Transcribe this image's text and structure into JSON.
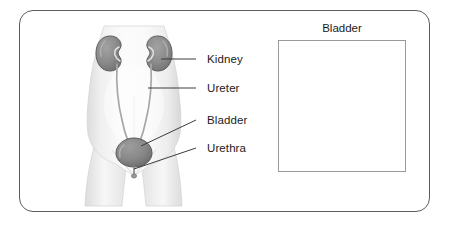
{
  "figure": {
    "kind": "medical-illustration",
    "frame": {
      "border_color": "#5c5c5c",
      "background": "#ffffff"
    }
  },
  "labels": [
    {
      "id": "kidney",
      "text": "Kidney",
      "x": 207,
      "y": 54,
      "leader": {
        "x1": 196,
        "y1": 59,
        "x2": 161,
        "y2": 59
      }
    },
    {
      "id": "ureter",
      "text": "Ureter",
      "x": 207,
      "y": 83,
      "leader": {
        "x1": 196,
        "y1": 88,
        "x2": 148,
        "y2": 88
      }
    },
    {
      "id": "bladder",
      "text": "Bladder",
      "x": 207,
      "y": 115,
      "leader": {
        "x1": 196,
        "y1": 120,
        "x2": 141,
        "y2": 144
      }
    },
    {
      "id": "urethra",
      "text": "Urethra",
      "x": 207,
      "y": 143,
      "leader": {
        "x1": 196,
        "y1": 148,
        "x2": 133,
        "y2": 165
      }
    }
  ],
  "inset": {
    "title": "Bladder",
    "border_color": "#9a9a9a",
    "box": {
      "x": 278,
      "y": 40,
      "width": 128,
      "height": 132
    }
  },
  "colors": {
    "body_fill": "#f2f2f2",
    "body_shade": "#d8d8d8",
    "organ_gray": "#8a8a8a",
    "organ_dark": "#6f6f6f",
    "organ_outline": "#5a5a5a",
    "ureter_line": "#9e9e9e",
    "leader_line": "#3c3c3c",
    "text": "#1b1b1b",
    "bladder_rim": "#b9b9b9",
    "bladder_cavity": "#8f8f8f"
  }
}
